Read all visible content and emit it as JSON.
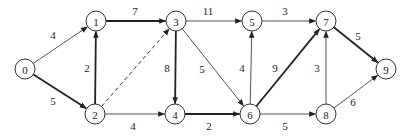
{
  "diagram": {
    "type": "directed-weighted-graph",
    "node_radius": 10,
    "colors": {
      "stroke": "#333333",
      "text": "#222222",
      "background": "#ffffff"
    },
    "nodes": [
      {
        "id": "0",
        "label": "0",
        "x": 25,
        "y": 69
      },
      {
        "id": "1",
        "label": "1",
        "x": 96,
        "y": 21
      },
      {
        "id": "2",
        "label": "2",
        "x": 95,
        "y": 114
      },
      {
        "id": "3",
        "label": "3",
        "x": 176,
        "y": 21
      },
      {
        "id": "4",
        "label": "4",
        "x": 175,
        "y": 114
      },
      {
        "id": "5",
        "label": "5",
        "x": 252,
        "y": 21
      },
      {
        "id": "6",
        "label": "6",
        "x": 250,
        "y": 114
      },
      {
        "id": "7",
        "label": "7",
        "x": 326,
        "y": 21
      },
      {
        "id": "8",
        "label": "8",
        "x": 326,
        "y": 114
      },
      {
        "id": "9",
        "label": "9",
        "x": 386,
        "y": 69
      }
    ],
    "edges": [
      {
        "from": "0",
        "to": "1",
        "weight": "4",
        "style": "thin",
        "lx": 53,
        "ly": 35
      },
      {
        "from": "0",
        "to": "2",
        "weight": "5",
        "style": "bold",
        "lx": 53,
        "ly": 101
      },
      {
        "from": "2",
        "to": "1",
        "weight": "2",
        "style": "bold",
        "lx": 87,
        "ly": 68
      },
      {
        "from": "1",
        "to": "3",
        "weight": "7",
        "style": "bold",
        "lx": 135,
        "ly": 11
      },
      {
        "from": "2",
        "to": "3",
        "weight": "",
        "style": "dashed",
        "lx": 0,
        "ly": 0
      },
      {
        "from": "2",
        "to": "4",
        "weight": "4",
        "style": "thin",
        "lx": 133,
        "ly": 126
      },
      {
        "from": "3",
        "to": "5",
        "weight": "11",
        "style": "thin",
        "lx": 208,
        "ly": 11
      },
      {
        "from": "3",
        "to": "4",
        "weight": "8",
        "style": "bold",
        "lx": 167,
        "ly": 68
      },
      {
        "from": "3",
        "to": "6",
        "weight": "5",
        "style": "thin",
        "lx": 202,
        "ly": 69
      },
      {
        "from": "4",
        "to": "6",
        "weight": "2",
        "style": "bold",
        "lx": 209,
        "ly": 126
      },
      {
        "from": "6",
        "to": "5",
        "weight": "4",
        "style": "thin",
        "lx": 242,
        "ly": 68
      },
      {
        "from": "5",
        "to": "7",
        "weight": "3",
        "style": "thin",
        "lx": 285,
        "ly": 11
      },
      {
        "from": "6",
        "to": "7",
        "weight": "9",
        "style": "bold",
        "lx": 275,
        "ly": 68
      },
      {
        "from": "6",
        "to": "8",
        "weight": "5",
        "style": "thin",
        "lx": 285,
        "ly": 126
      },
      {
        "from": "8",
        "to": "7",
        "weight": "3",
        "style": "thin",
        "lx": 317,
        "ly": 68
      },
      {
        "from": "7",
        "to": "9",
        "weight": "5",
        "style": "bold",
        "lx": 358,
        "ly": 36
      },
      {
        "from": "8",
        "to": "9",
        "weight": "6",
        "style": "thin",
        "lx": 353,
        "ly": 102
      }
    ]
  }
}
